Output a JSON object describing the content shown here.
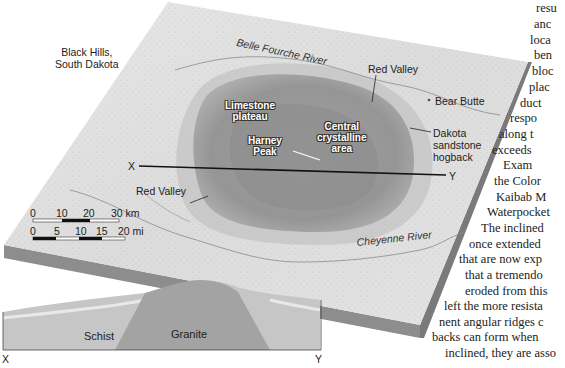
{
  "figure": {
    "region_label": "Black Hills,\nSouth Dakota",
    "region_label_lines": [
      "Black Hills,",
      "South Dakota"
    ],
    "rivers": {
      "north": "Belle Fourche River",
      "south": "Cheyenne River"
    },
    "labels": {
      "red_valley_north": "Red Valley",
      "red_valley_west": "Red Valley",
      "bear_butte": "Bear Butte",
      "dakota_hogback": [
        "Dakota",
        "sandstone",
        "hogback"
      ],
      "limestone_plateau": [
        "Limestone",
        "plateau"
      ],
      "harney_peak": [
        "Harney",
        "Peak"
      ],
      "central_area": [
        "Central",
        "crystalline",
        "area"
      ]
    },
    "section_line": {
      "start": "X",
      "end": "Y"
    },
    "scale_km": {
      "ticks": [
        "0",
        "10",
        "20",
        "30 km"
      ]
    },
    "scale_mi": {
      "ticks": [
        "0",
        "5",
        "10",
        "15",
        "20 mi"
      ]
    },
    "cross_section": {
      "left_end": "X",
      "right_end": "Y",
      "units": [
        "Schist",
        "Granite"
      ]
    },
    "colors": {
      "block_top": "#d9d9d9",
      "block_side": "#8a8a8a",
      "dome": "#9e9e9e",
      "core": "#8c8c8c",
      "granite": "#a0a0a0",
      "schist": "#c4c4c4"
    }
  },
  "body_text": {
    "lines": [
      "resu",
      "anc",
      "loca",
      "ben",
      "bloc",
      "plac",
      "duct",
      "respo",
      "along t",
      "exceeds",
      "Exam",
      "the Color",
      "Kaibab  M",
      "Waterpocket",
      "The inclined",
      "once extended",
      "that are now exp",
      "that a tremendo",
      "eroded from this",
      "left the more resista",
      "nent angular ridges c",
      "backs can form when",
      "inclined, they are asso"
    ]
  }
}
